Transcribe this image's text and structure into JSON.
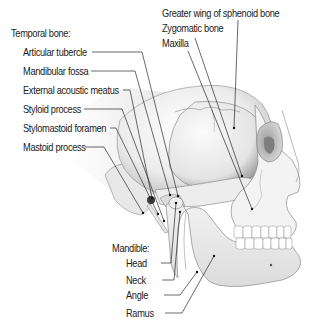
{
  "diagram": {
    "groups": {
      "temporal": {
        "heading": "Temporal bone:",
        "items": [
          {
            "label": "Articular tubercle"
          },
          {
            "label": "Mandibular fossa"
          },
          {
            "label": "External acoustic meatus"
          },
          {
            "label": "Styloid process"
          },
          {
            "label": "Stylomastoid foramen"
          },
          {
            "label": "Mastoid process"
          }
        ]
      },
      "top": {
        "items": [
          {
            "label": "Greater wing of sphenoid bone"
          },
          {
            "label": "Zygomatic bone"
          },
          {
            "label": "Maxilla"
          }
        ]
      },
      "mandible": {
        "heading": "Mandible:",
        "items": [
          {
            "label": "Head"
          },
          {
            "label": "Neck"
          },
          {
            "label": "Angle"
          },
          {
            "label": "Ramus"
          }
        ]
      }
    },
    "colors": {
      "bone_light": "#f4f4f4",
      "bone_shadow": "#bdbdbd",
      "outline": "#6e6e6e",
      "leader_line": "#2a2a2a",
      "text": "#1a1a1a"
    }
  }
}
